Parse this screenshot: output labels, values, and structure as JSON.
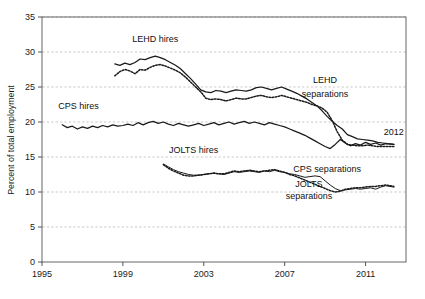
{
  "chart_data": {
    "type": "line",
    "title": "",
    "xlabel": "",
    "ylabel": "Percent of total employment",
    "xlim": [
      1995,
      2013
    ],
    "ylim": [
      0,
      35
    ],
    "xticks": [
      "1995",
      "1999",
      "2003",
      "2007",
      "2011"
    ],
    "xtick_values": [
      1995,
      1999,
      2003,
      2007,
      2011
    ],
    "yticks": [
      "0",
      "5",
      "10",
      "15",
      "20",
      "25",
      "30",
      "35"
    ],
    "ytick_values": [
      0,
      5,
      10,
      15,
      20,
      25,
      30,
      35
    ],
    "grid": true,
    "grid_axis": "y",
    "legend": "inline-annotations",
    "annotations": [
      {
        "text": "LEHD hires",
        "x": 2000.6,
        "y": 31.4
      },
      {
        "text": "CPS hires",
        "x": 1996.8,
        "y": 21.8
      },
      {
        "text": "LEHD",
        "x": 2009.0,
        "y": 25.6
      },
      {
        "text": "separations",
        "x": 2009.0,
        "y": 23.6
      },
      {
        "text": "2012",
        "x": 2012.4,
        "y": 18.1
      },
      {
        "text": "JOLTS hires",
        "x": 2002.5,
        "y": 15.6
      },
      {
        "text": "CPS separations",
        "x": 2009.1,
        "y": 12.9
      },
      {
        "text": "JOLTS",
        "x": 2008.2,
        "y": 10.7
      },
      {
        "text": "separations",
        "x": 2008.2,
        "y": 9.0
      }
    ],
    "series": [
      {
        "name": "LEHD hires",
        "style": "solid",
        "color": "#1a1a1a",
        "x": [
          1998.6,
          1998.85,
          1999.1,
          1999.35,
          1999.6,
          1999.85,
          2000.1,
          2000.35,
          2000.6,
          2000.85,
          2001.1,
          2001.35,
          2001.6,
          2001.85,
          2002.1,
          2002.35,
          2002.6,
          2002.85,
          2003.1,
          2003.35,
          2003.6,
          2003.85,
          2004.1,
          2004.35,
          2004.6,
          2004.85,
          2005.1,
          2005.35,
          2005.6,
          2005.85,
          2006.1,
          2006.35,
          2006.6,
          2006.85,
          2007.1,
          2007.35,
          2007.6,
          2007.85,
          2008.1,
          2008.35,
          2008.6,
          2008.85,
          2009.1,
          2009.35,
          2009.6,
          2009.85,
          2010.1,
          2010.35,
          2010.6,
          2010.85,
          2011.1,
          2011.35,
          2011.6,
          2011.85,
          2012.1,
          2012.4
        ],
        "y": [
          28.3,
          28.1,
          28.4,
          28.2,
          28.5,
          29.0,
          28.9,
          29.2,
          29.4,
          29.2,
          28.9,
          28.5,
          28.1,
          27.6,
          26.9,
          26.2,
          25.4,
          24.6,
          24.3,
          24.2,
          24.5,
          24.4,
          24.2,
          24.4,
          24.6,
          24.5,
          24.4,
          24.6,
          24.9,
          25.0,
          24.8,
          24.6,
          24.8,
          25.0,
          24.7,
          24.4,
          24.1,
          23.7,
          23.3,
          22.8,
          22.3,
          21.6,
          20.8,
          20.1,
          19.5,
          19.0,
          18.2,
          17.9,
          17.6,
          17.5,
          17.4,
          17.3,
          17.1,
          17.0,
          16.9,
          16.8
        ]
      },
      {
        "name": "LEHD separations",
        "style": "dotted",
        "color": "#1a1a1a",
        "x": [
          1998.6,
          1998.85,
          1999.1,
          1999.35,
          1999.6,
          1999.85,
          2000.1,
          2000.35,
          2000.6,
          2000.85,
          2001.1,
          2001.35,
          2001.6,
          2001.85,
          2002.1,
          2002.35,
          2002.6,
          2002.85,
          2003.1,
          2003.35,
          2003.6,
          2003.85,
          2004.1,
          2004.35,
          2004.6,
          2004.85,
          2005.1,
          2005.35,
          2005.6,
          2005.85,
          2006.1,
          2006.35,
          2006.6,
          2006.85,
          2007.1,
          2007.35,
          2007.6,
          2007.85,
          2008.1,
          2008.35,
          2008.6,
          2008.85,
          2009.1,
          2009.35,
          2009.6,
          2009.85,
          2010.1,
          2010.35,
          2010.6,
          2010.85,
          2011.1,
          2011.35,
          2011.6,
          2011.85,
          2012.1,
          2012.4
        ],
        "y": [
          26.6,
          27.2,
          27.5,
          27.3,
          26.9,
          27.5,
          27.4,
          27.8,
          28.1,
          28.2,
          28.0,
          27.7,
          27.4,
          27.0,
          26.4,
          25.7,
          25.0,
          24.3,
          23.4,
          23.2,
          23.3,
          23.2,
          23.0,
          23.2,
          23.4,
          23.3,
          23.3,
          23.5,
          23.7,
          23.8,
          23.6,
          23.5,
          23.6,
          23.8,
          23.6,
          23.4,
          23.2,
          23.0,
          22.8,
          22.5,
          22.3,
          22.0,
          21.4,
          20.2,
          18.6,
          17.4,
          16.8,
          16.7,
          16.6,
          16.6,
          16.7,
          16.6,
          16.5,
          16.5,
          16.5,
          16.5
        ]
      },
      {
        "name": "CPS hires",
        "style": "solid",
        "color": "#1a1a1a",
        "x": [
          1996.0,
          1996.25,
          1996.5,
          1996.75,
          1997.0,
          1997.25,
          1997.5,
          1997.75,
          1998.0,
          1998.25,
          1998.5,
          1998.75,
          1999.0,
          1999.25,
          1999.5,
          1999.75,
          2000.0,
          2000.25,
          2000.5,
          2000.75,
          2001.0,
          2001.25,
          2001.5,
          2001.75,
          2002.0,
          2002.25,
          2002.5,
          2002.75,
          2003.0,
          2003.25,
          2003.5,
          2003.75,
          2004.0,
          2004.25,
          2004.5,
          2004.75,
          2005.0,
          2005.25,
          2005.5,
          2005.75,
          2006.0,
          2006.25,
          2006.5,
          2006.75,
          2007.0,
          2007.25,
          2007.5,
          2007.75,
          2008.0,
          2008.25,
          2008.5,
          2008.75,
          2009.0,
          2009.25,
          2009.5,
          2009.75,
          2010.0,
          2010.25,
          2010.5,
          2010.75,
          2011.0,
          2011.25,
          2011.5,
          2011.75,
          2012.0,
          2012.4
        ],
        "y": [
          19.6,
          19.2,
          19.4,
          19.0,
          19.3,
          19.1,
          19.4,
          19.2,
          19.5,
          19.3,
          19.6,
          19.4,
          19.5,
          19.7,
          19.5,
          19.9,
          19.6,
          19.9,
          20.1,
          19.8,
          20.0,
          19.7,
          19.5,
          19.8,
          19.6,
          19.4,
          19.6,
          19.8,
          19.5,
          19.7,
          19.9,
          19.6,
          19.8,
          20.0,
          19.7,
          19.9,
          20.1,
          19.8,
          20.0,
          19.8,
          19.6,
          19.9,
          19.7,
          19.5,
          19.3,
          19.0,
          18.7,
          18.4,
          18.1,
          17.7,
          17.3,
          16.9,
          16.5,
          16.2,
          16.8,
          17.5,
          17.0,
          16.6,
          16.9,
          16.7,
          17.1,
          16.8,
          17.0,
          16.7,
          16.9,
          16.8
        ]
      },
      {
        "name": "CPS separations",
        "style": "solid-thin",
        "color": "#1a1a1a",
        "x": [
          2001.0,
          2001.25,
          2001.5,
          2001.75,
          2002.0,
          2002.25,
          2002.5,
          2002.75,
          2003.0,
          2003.25,
          2003.5,
          2003.75,
          2004.0,
          2004.25,
          2004.5,
          2004.75,
          2005.0,
          2005.25,
          2005.5,
          2005.75,
          2006.0,
          2006.25,
          2006.5,
          2006.75,
          2007.0,
          2007.25,
          2007.5,
          2007.75,
          2008.0,
          2008.25,
          2008.5,
          2008.75,
          2009.0,
          2009.25,
          2009.5,
          2009.75,
          2010.0,
          2010.25,
          2010.5,
          2010.75,
          2011.0,
          2011.25,
          2011.5,
          2011.75,
          2012.0,
          2012.4
        ],
        "y": [
          14.0,
          13.6,
          13.2,
          12.9,
          12.7,
          12.5,
          12.4,
          12.4,
          12.5,
          12.6,
          12.7,
          12.6,
          12.5,
          12.7,
          12.9,
          12.8,
          12.9,
          13.0,
          12.9,
          12.8,
          13.0,
          12.9,
          13.1,
          12.9,
          12.8,
          12.6,
          12.5,
          12.3,
          12.1,
          12.2,
          12.3,
          12.2,
          11.6,
          11.0,
          10.5,
          10.2,
          10.3,
          10.4,
          10.5,
          10.4,
          10.5,
          10.6,
          10.4,
          10.7,
          10.9,
          10.7
        ]
      },
      {
        "name": "JOLTS separations",
        "style": "dotted",
        "color": "#1a1a1a",
        "x": [
          2001.0,
          2001.25,
          2001.5,
          2001.75,
          2002.0,
          2002.25,
          2002.5,
          2002.75,
          2003.0,
          2003.25,
          2003.5,
          2003.75,
          2004.0,
          2004.25,
          2004.5,
          2004.75,
          2005.0,
          2005.25,
          2005.5,
          2005.75,
          2006.0,
          2006.25,
          2006.5,
          2006.75,
          2007.0,
          2007.25,
          2007.5,
          2007.75,
          2008.0,
          2008.25,
          2008.5,
          2008.75,
          2009.0,
          2009.25,
          2009.5,
          2009.75,
          2010.0,
          2010.25,
          2010.5,
          2010.75,
          2011.0,
          2011.25,
          2011.5,
          2011.75,
          2012.0,
          2012.4
        ],
        "y": [
          13.9,
          13.4,
          13.0,
          12.7,
          12.4,
          12.3,
          12.3,
          12.4,
          12.5,
          12.6,
          12.7,
          12.6,
          12.6,
          12.8,
          13.0,
          12.9,
          13.0,
          13.1,
          13.0,
          12.9,
          13.0,
          13.1,
          13.2,
          13.0,
          12.8,
          12.5,
          12.3,
          12.0,
          11.7,
          11.4,
          11.1,
          10.8,
          10.5,
          10.2,
          10.0,
          10.1,
          10.4,
          10.5,
          10.6,
          10.6,
          10.7,
          10.8,
          10.8,
          10.9,
          11.0,
          10.8
        ]
      }
    ]
  }
}
